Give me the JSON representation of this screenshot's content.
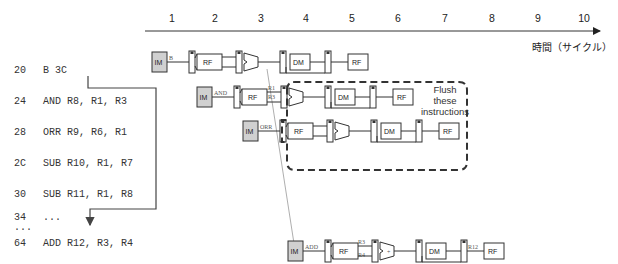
{
  "timeline": {
    "ticks": [
      "1",
      "2",
      "3",
      "4",
      "5",
      "6",
      "7",
      "8",
      "9",
      "10"
    ],
    "axis_label": "時間（サイクル）"
  },
  "instructions": [
    {
      "addr": "20",
      "text": "B 3C"
    },
    {
      "addr": "24",
      "text": "AND R8, R1, R3"
    },
    {
      "addr": "28",
      "text": "ORR R9, R6, R1"
    },
    {
      "addr": "2C",
      "text": "SUB R10, R1, R7"
    },
    {
      "addr": "30",
      "text": "SUB R11, R1, R8"
    },
    {
      "addr": "34",
      "text": "..."
    },
    {
      "addr": "...",
      "text": ""
    },
    {
      "addr": "64",
      "text": "ADD R12, R3, R4"
    }
  ],
  "pipeline": {
    "stage_labels": {
      "im": "IM",
      "rf": "RF",
      "dm": "DM"
    },
    "rows": [
      {
        "op": "B",
        "regs": []
      },
      {
        "op": "AND",
        "regs": [
          "R1",
          "R3"
        ]
      },
      {
        "op": "ORR",
        "regs": []
      },
      {
        "op": "ADD",
        "regs": [
          "R3",
          "R4"
        ],
        "dest": "R12"
      }
    ]
  },
  "flush_note": {
    "line1": "Flush",
    "line2": "these",
    "line3": "instructions"
  },
  "colors": {
    "im_fill": "#d0d0d0",
    "line": "#333333",
    "flush_border": "#333333",
    "arrow": "#888888"
  }
}
